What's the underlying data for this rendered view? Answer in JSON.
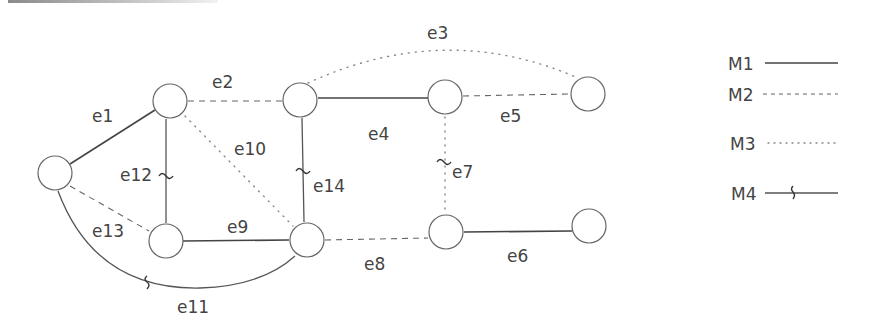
{
  "diagram": {
    "type": "graph",
    "nodes": [
      {
        "id": "A",
        "x": 55,
        "y": 173
      },
      {
        "id": "B",
        "x": 170,
        "y": 101
      },
      {
        "id": "C",
        "x": 166,
        "y": 241
      },
      {
        "id": "D",
        "x": 307,
        "y": 240
      },
      {
        "id": "E",
        "x": 300,
        "y": 100
      },
      {
        "id": "F",
        "x": 445,
        "y": 97
      },
      {
        "id": "G",
        "x": 588,
        "y": 94
      },
      {
        "id": "H",
        "x": 446,
        "y": 232
      },
      {
        "id": "I",
        "x": 589,
        "y": 226
      }
    ],
    "edges": [
      {
        "id": "e1",
        "label": "e1",
        "from": "A",
        "to": "B",
        "type": "M1"
      },
      {
        "id": "e2",
        "label": "e2",
        "from": "B",
        "to": "E",
        "type": "M2"
      },
      {
        "id": "e3",
        "label": "e3",
        "from": "E",
        "to": "G",
        "type": "M3"
      },
      {
        "id": "e4",
        "label": "e4",
        "from": "E",
        "to": "F",
        "type": "M1"
      },
      {
        "id": "e5",
        "label": "e5",
        "from": "F",
        "to": "G",
        "type": "M2"
      },
      {
        "id": "e6",
        "label": "e6",
        "from": "H",
        "to": "I",
        "type": "M1"
      },
      {
        "id": "e7",
        "label": "e7",
        "from": "F",
        "to": "H",
        "type": "M3",
        "marker": "~"
      },
      {
        "id": "e8",
        "label": "e8",
        "from": "D",
        "to": "H",
        "type": "M2"
      },
      {
        "id": "e9",
        "label": "e9",
        "from": "C",
        "to": "D",
        "type": "M1"
      },
      {
        "id": "e10",
        "label": "e10",
        "from": "B",
        "to": "D",
        "type": "M3"
      },
      {
        "id": "e11",
        "label": "e11",
        "from": "A",
        "to": "D",
        "type": "M4"
      },
      {
        "id": "e12",
        "label": "e12",
        "from": "B",
        "to": "C",
        "type": "M4",
        "marker": "~"
      },
      {
        "id": "e13",
        "label": "e13",
        "from": "A",
        "to": "C",
        "type": "M2"
      },
      {
        "id": "e14",
        "label": "e14",
        "from": "E",
        "to": "D",
        "type": "M4",
        "marker": "~"
      }
    ]
  },
  "labels": {
    "e1": "e1",
    "e2": "e2",
    "e3": "e3",
    "e4": "e4",
    "e5": "e5",
    "e6": "e6",
    "e7": "e7",
    "e8": "e8",
    "e9": "e9",
    "e10": "e10",
    "e11": "e11",
    "e12": "e12",
    "e13": "e13",
    "e14": "e14"
  },
  "legend": {
    "items": [
      {
        "label": "M1",
        "style": "solid"
      },
      {
        "label": "M2",
        "style": "dashed"
      },
      {
        "label": "M3",
        "style": "dotted"
      },
      {
        "label": "M4",
        "style": "solid-with-squiggle"
      }
    ]
  },
  "colors": {
    "line": "#444444",
    "node_stroke": "#666666",
    "text": "#444444",
    "background": "#ffffff"
  }
}
